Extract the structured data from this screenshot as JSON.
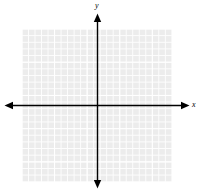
{
  "figure": {
    "type": "cartesian-coordinate-plane",
    "title": "",
    "background_color": "#ffffff"
  },
  "axes": {
    "x": {
      "label": "x",
      "color": "#000000",
      "orientation": "horizontal",
      "position_y": 105,
      "start_x": 5,
      "end_x": 189,
      "arrowheads": "both"
    },
    "y": {
      "label": "y",
      "color": "#000000",
      "orientation": "vertical",
      "position_x": 97,
      "start_y": 14,
      "end_y": 188,
      "arrowheads": "both"
    },
    "origin": {
      "x": 97,
      "y": 105
    }
  },
  "grid": {
    "visible": true,
    "fill_color": "#ececec",
    "minor_line_color": "#fdfdfd",
    "major_line_color": "#ffffff",
    "minor_cell_px": 6.5,
    "major_every_n_cells": 5,
    "columns": 23,
    "rows": 23,
    "left_px": 22,
    "top_px": 29,
    "width_px": 150,
    "height_px": 153
  },
  "plot": {
    "series": [],
    "points": [],
    "annotations": []
  }
}
